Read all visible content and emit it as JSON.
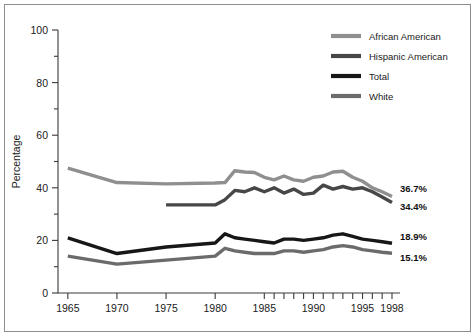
{
  "chart_data": {
    "type": "line",
    "title": "",
    "subtitle": "",
    "xlabel": "",
    "ylabel": "Percentage",
    "xlim": [
      1964,
      1998
    ],
    "ylim": [
      0,
      100
    ],
    "grid": false,
    "legend_position": "top-right",
    "y_ticks": [
      "0",
      "20",
      "40",
      "60",
      "80",
      "100"
    ],
    "y_tick_values": [
      0,
      20,
      40,
      60,
      80,
      100
    ],
    "y_minor_tick_values": [
      10,
      30,
      50,
      70,
      90
    ],
    "x_ticks": [
      "1965",
      "1970",
      "1975",
      "1980",
      "1985",
      "1990",
      "1995",
      "1998"
    ],
    "x_tick_values": [
      1965,
      1970,
      1975,
      1980,
      1985,
      1990,
      1995,
      1998
    ],
    "x_minor_tick_values": [
      1986,
      1987,
      1988,
      1989,
      1991,
      1992,
      1993,
      1994,
      1996,
      1997
    ],
    "series": [
      {
        "name": "African American",
        "color": "#8f8f8f",
        "width": 3.4,
        "x": [
          1965,
          1970,
          1975,
          1980,
          1981,
          1982,
          1983,
          1984,
          1985,
          1986,
          1987,
          1988,
          1989,
          1990,
          1991,
          1992,
          1993,
          1994,
          1995,
          1996,
          1997,
          1998
        ],
        "values": [
          47.5,
          42.0,
          41.5,
          41.8,
          42.0,
          46.5,
          46.0,
          45.8,
          44.0,
          43.0,
          44.5,
          43.0,
          42.5,
          44.0,
          44.5,
          46.0,
          46.3,
          44.0,
          42.5,
          40.0,
          38.5,
          36.7
        ],
        "end_label": "36.7%"
      },
      {
        "name": "Hispanic American",
        "color": "#474747",
        "width": 3.4,
        "x": [
          1975,
          1976,
          1977,
          1978,
          1979,
          1980,
          1981,
          1982,
          1983,
          1984,
          1985,
          1986,
          1987,
          1988,
          1989,
          1990,
          1991,
          1992,
          1993,
          1994,
          1995,
          1996,
          1997,
          1998
        ],
        "values": [
          33.5,
          33.5,
          33.5,
          33.5,
          33.5,
          33.5,
          35.5,
          39.0,
          38.5,
          40.0,
          38.5,
          40.0,
          38.0,
          39.5,
          37.5,
          38.0,
          41.0,
          39.5,
          40.5,
          39.5,
          40.0,
          38.5,
          36.5,
          34.4
        ],
        "end_label": "34.4%"
      },
      {
        "name": "Total",
        "color": "#171717",
        "width": 3.4,
        "x": [
          1965,
          1970,
          1975,
          1980,
          1981,
          1982,
          1983,
          1984,
          1985,
          1986,
          1987,
          1988,
          1989,
          1990,
          1991,
          1992,
          1993,
          1994,
          1995,
          1996,
          1997,
          1998
        ],
        "values": [
          21.0,
          15.0,
          17.5,
          19.0,
          22.5,
          21.0,
          20.5,
          20.0,
          19.5,
          19.0,
          20.5,
          20.5,
          20.0,
          20.5,
          21.0,
          22.0,
          22.5,
          21.5,
          20.5,
          20.0,
          19.5,
          18.9
        ],
        "end_label": "18.9%"
      },
      {
        "name": "White",
        "color": "#6b6b6b",
        "width": 3.4,
        "x": [
          1965,
          1970,
          1975,
          1980,
          1981,
          1982,
          1983,
          1984,
          1985,
          1986,
          1987,
          1988,
          1989,
          1990,
          1991,
          1992,
          1993,
          1994,
          1995,
          1996,
          1997,
          1998
        ],
        "values": [
          14.0,
          11.0,
          12.5,
          14.0,
          17.0,
          16.0,
          15.5,
          15.0,
          15.0,
          15.0,
          16.0,
          16.0,
          15.5,
          16.0,
          16.5,
          17.5,
          18.0,
          17.5,
          16.5,
          16.0,
          15.5,
          15.1
        ],
        "end_label": "15.1%"
      }
    ],
    "end_labels": [
      {
        "text": "36.7%",
        "series": "African American"
      },
      {
        "text": "34.4%",
        "series": "Hispanic American"
      },
      {
        "text": "18.9%",
        "series": "Total"
      },
      {
        "text": "15.1%",
        "series": "White"
      }
    ],
    "legend": [
      {
        "label": "African American",
        "color": "#8f8f8f"
      },
      {
        "label": "Hispanic American",
        "color": "#474747"
      },
      {
        "label": "Total",
        "color": "#171717"
      },
      {
        "label": "White",
        "color": "#6b6b6b"
      }
    ]
  }
}
